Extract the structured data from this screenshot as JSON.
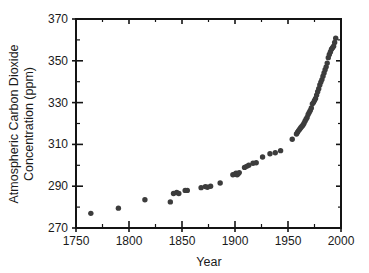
{
  "figure": {
    "background_color": "#ffffff",
    "marker_color": "#3c3c3c",
    "axis_color": "#141414"
  },
  "chart_data": {
    "type": "scatter",
    "title": "",
    "xlabel": "Year",
    "ylabel_line1": "Atmospheric Carbon Dioxide",
    "ylabel_line2": "Concentration (ppm)",
    "ylabel": "Atmospheric Carbon Dioxide Concentration (ppm)",
    "xlim": [
      1750,
      2000
    ],
    "ylim": [
      270,
      370
    ],
    "grid": false,
    "legend": null,
    "x_ticks": [
      1750,
      1800,
      1850,
      1900,
      1950,
      2000
    ],
    "x_tick_labels": [
      "1750",
      "1800",
      "1850",
      "1900",
      "1950",
      "2000"
    ],
    "x_minor_tick_step": 25,
    "y_ticks": [
      270,
      290,
      310,
      330,
      350,
      370
    ],
    "y_tick_labels": [
      "270",
      "290",
      "310",
      "330",
      "350",
      "370"
    ],
    "y_minor_tick_step": 10,
    "series": [
      {
        "name": "Atmospheric CO2",
        "marker": "circle",
        "marker_color": "#3c3c3c",
        "points": [
          [
            1764,
            277.0
          ],
          [
            1790,
            279.5
          ],
          [
            1815,
            283.5
          ],
          [
            1839,
            282.5
          ],
          [
            1842,
            286.5
          ],
          [
            1845,
            287.0
          ],
          [
            1847,
            286.5
          ],
          [
            1853,
            288.0
          ],
          [
            1855,
            288.0
          ],
          [
            1868,
            289.3
          ],
          [
            1872,
            289.8
          ],
          [
            1874,
            289.5
          ],
          [
            1877,
            290.0
          ],
          [
            1886,
            291.5
          ],
          [
            1898,
            295.5
          ],
          [
            1900,
            295.8
          ],
          [
            1901,
            296.2
          ],
          [
            1902,
            295.5
          ],
          [
            1903,
            296.0
          ],
          [
            1904,
            296.5
          ],
          [
            1909,
            299.0
          ],
          [
            1911,
            299.5
          ],
          [
            1913,
            300.0
          ],
          [
            1917,
            301.0
          ],
          [
            1920,
            301.2
          ],
          [
            1926,
            304.0
          ],
          [
            1933,
            305.5
          ],
          [
            1938,
            306.0
          ],
          [
            1943,
            307.0
          ],
          [
            1954,
            312.5
          ],
          [
            1958,
            315.0
          ],
          [
            1959,
            315.8
          ],
          [
            1960,
            316.6
          ],
          [
            1961,
            317.3
          ],
          [
            1962,
            318.0
          ],
          [
            1963,
            318.6
          ],
          [
            1964,
            319.2
          ],
          [
            1965,
            320.0
          ],
          [
            1966,
            321.1
          ],
          [
            1967,
            322.0
          ],
          [
            1968,
            322.9
          ],
          [
            1969,
            324.3
          ],
          [
            1970,
            325.3
          ],
          [
            1971,
            326.2
          ],
          [
            1972,
            327.4
          ],
          [
            1973,
            329.4
          ],
          [
            1974,
            330.0
          ],
          [
            1975,
            331.0
          ],
          [
            1976,
            332.0
          ],
          [
            1977,
            333.6
          ],
          [
            1978,
            335.2
          ],
          [
            1979,
            336.6
          ],
          [
            1980,
            338.4
          ],
          [
            1981,
            339.8
          ],
          [
            1982,
            341.0
          ],
          [
            1983,
            342.6
          ],
          [
            1984,
            344.2
          ],
          [
            1985,
            345.7
          ],
          [
            1986,
            347.1
          ],
          [
            1987,
            348.9
          ],
          [
            1988,
            351.5
          ],
          [
            1989,
            353.0
          ],
          [
            1990,
            354.2
          ],
          [
            1991,
            355.5
          ],
          [
            1992,
            356.3
          ],
          [
            1993,
            357.0
          ],
          [
            1994,
            358.8
          ],
          [
            1995,
            360.8
          ]
        ]
      }
    ]
  }
}
